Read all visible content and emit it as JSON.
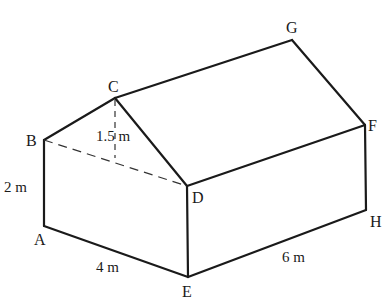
{
  "figure": {
    "vertices": {
      "A": {
        "label": "A",
        "x": 44,
        "y": 226
      },
      "B": {
        "label": "B",
        "x": 44,
        "y": 140
      },
      "C": {
        "label": "C",
        "x": 115,
        "y": 98
      },
      "D": {
        "label": "D",
        "x": 187,
        "y": 186
      },
      "E": {
        "label": "E",
        "x": 188,
        "y": 277
      },
      "F": {
        "label": "F",
        "x": 365,
        "y": 125
      },
      "G": {
        "label": "G",
        "x": 292,
        "y": 40
      },
      "H": {
        "label": "H",
        "x": 366,
        "y": 210
      }
    },
    "dimensions": {
      "wall_height": "2 m",
      "roof_height": "1.5 m",
      "width_AE": "4 m",
      "length_EH": "6 m"
    }
  }
}
